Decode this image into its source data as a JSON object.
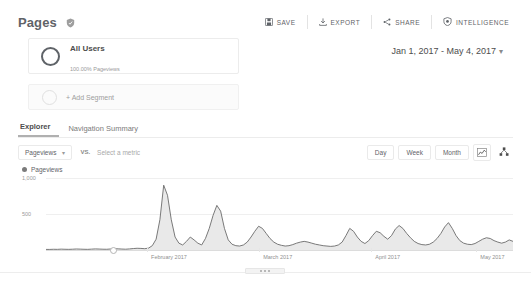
{
  "header": {
    "title": "Pages",
    "title_badge_icon": "shield-check-icon",
    "actions": [
      {
        "label": "SAVE",
        "icon": "save-icon"
      },
      {
        "label": "EXPORT",
        "icon": "export-download-icon"
      },
      {
        "label": "SHARE",
        "icon": "share-icon"
      },
      {
        "label": "INTELLIGENCE",
        "icon": "intelligence-shield-icon"
      }
    ]
  },
  "segments": {
    "applied": {
      "name": "All Users",
      "sublabel": "100.00% Pageviews",
      "ring_icon": "segment-ring-icon"
    },
    "add_segment_label": "+ Add Segment",
    "add_segment_ring_icon": "segment-ring-empty-icon"
  },
  "date_range": {
    "label": "Jan 1, 2017 - May 4, 2017",
    "caret_icon": "chevron-down-icon"
  },
  "tabs": [
    {
      "label": "Explorer",
      "active": true
    },
    {
      "label": "Navigation Summary",
      "active": false
    }
  ],
  "metric_row": {
    "primary_metric": "Pageviews",
    "primary_caret_icon": "chevron-down-icon",
    "vs_label": "VS.",
    "secondary_metric_placeholder": "Select a metric",
    "granularity": [
      {
        "label": "Day"
      },
      {
        "label": "Week"
      },
      {
        "label": "Month"
      }
    ],
    "chart_type_icon": "line-chart-icon",
    "annotations_icon": "scatter-nodes-icon"
  },
  "chart_data": {
    "type": "area",
    "title": "Pageviews",
    "xlabel": "",
    "ylabel": "",
    "ylim": [
      0,
      1000
    ],
    "yticks": [
      1000,
      500
    ],
    "ytick_labels": [
      "1,000",
      "500"
    ],
    "grid": true,
    "legend": [
      "Pageviews"
    ],
    "legend_position": "top-left",
    "xtick_labels": [
      "February 2017",
      "March 2017",
      "April 2017",
      "May 2017"
    ],
    "xtick_positions_pct": [
      22.5,
      46.5,
      70.5,
      93.0
    ],
    "series_name": "Pageviews",
    "line_color": "#6b6b6b",
    "fill_color": "#e8e8e8",
    "marker_position_pct": 14.5,
    "x": [
      0,
      1,
      2,
      3,
      4,
      5,
      6,
      7,
      8,
      9,
      10,
      11,
      12,
      13,
      14,
      15,
      16,
      17,
      18,
      19,
      20,
      21,
      22,
      23,
      24,
      25,
      26,
      27,
      28,
      29,
      30,
      31,
      32,
      33,
      34,
      35,
      36,
      37,
      38,
      39,
      40,
      41,
      42,
      43,
      44,
      45,
      46,
      47,
      48,
      49,
      50,
      51,
      52,
      53,
      54,
      55,
      56,
      57,
      58,
      59,
      60,
      61,
      62,
      63,
      64,
      65,
      66,
      67,
      68,
      69,
      70,
      71,
      72,
      73,
      74,
      75,
      76,
      77,
      78,
      79,
      80,
      81,
      82,
      83,
      84,
      85,
      86,
      87,
      88,
      89,
      90,
      91,
      92,
      93,
      94,
      95,
      96,
      97,
      98,
      99,
      100,
      101,
      102,
      103,
      104,
      105,
      106,
      107,
      108,
      109,
      110,
      111,
      112,
      113,
      114,
      115,
      116,
      117,
      118,
      119,
      120,
      121,
      122,
      123
    ],
    "values": [
      8,
      8,
      10,
      9,
      12,
      10,
      9,
      11,
      14,
      12,
      10,
      9,
      12,
      15,
      13,
      11,
      10,
      14,
      18,
      16,
      13,
      11,
      15,
      20,
      24,
      22,
      18,
      26,
      60,
      150,
      420,
      900,
      760,
      420,
      180,
      95,
      70,
      120,
      180,
      140,
      95,
      70,
      160,
      300,
      480,
      620,
      540,
      300,
      140,
      80,
      60,
      55,
      70,
      110,
      180,
      260,
      330,
      300,
      230,
      160,
      110,
      80,
      65,
      55,
      60,
      75,
      95,
      110,
      120,
      110,
      95,
      80,
      70,
      60,
      55,
      50,
      55,
      70,
      110,
      200,
      300,
      260,
      180,
      120,
      90,
      130,
      200,
      260,
      240,
      190,
      150,
      200,
      290,
      340,
      300,
      230,
      170,
      120,
      90,
      75,
      70,
      80,
      110,
      160,
      230,
      320,
      380,
      300,
      200,
      130,
      95,
      80,
      75,
      90,
      120,
      150,
      170,
      160,
      130,
      110,
      95,
      110,
      140,
      120
    ]
  },
  "footer": {
    "drag_handle_icon": "drag-handle-icon"
  }
}
